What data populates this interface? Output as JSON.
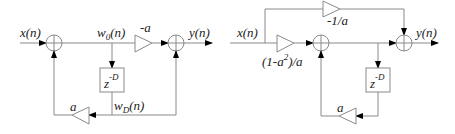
{
  "diagrams": [
    {
      "id": "left",
      "title": "Comb filter with feedforward and feedback",
      "labels": {
        "input": "x(n)",
        "internal": "w",
        "internal_sub": "0",
        "internal_arg": "(n)",
        "gain_forward": "-a",
        "output": "y(n)",
        "delay": "z",
        "delay_exp": "-D",
        "gain_feedback": "a",
        "delayed": "w",
        "delayed_sub": "D",
        "delayed_arg": "(n)"
      }
    },
    {
      "id": "right",
      "title": "Allpass realization",
      "labels": {
        "input": "x(n)",
        "gain_top": "-1/a",
        "gain_input_pre": "(1-a",
        "gain_input_exp": "2",
        "gain_input_post": ")/a",
        "output": "y(n)",
        "delay": "z",
        "delay_exp": "-D",
        "gain_feedback": "a"
      }
    }
  ],
  "colors": {
    "line": "#8a8a8a",
    "arrow": "#000000",
    "text": "#222222",
    "background": "#ffffff"
  }
}
